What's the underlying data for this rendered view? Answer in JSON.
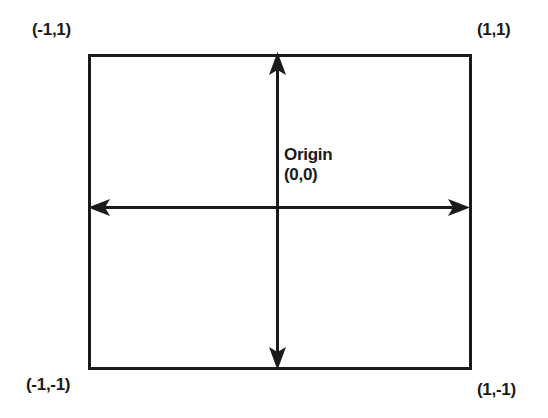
{
  "diagram": {
    "type": "coordinate-diagram",
    "stroke_color": "#1a1a1a",
    "background_color": "#ffffff",
    "box": {
      "name": "coordinate-box",
      "x": 88,
      "y": 54,
      "width": 382,
      "height": 314,
      "stroke_width": 3
    },
    "axes": {
      "horizontal": {
        "name": "x-axis",
        "y": 207.5,
        "x_start": 88,
        "x_end": 470,
        "stroke_width": 3,
        "arrow_left": true,
        "arrow_right": true
      },
      "vertical": {
        "name": "y-axis",
        "x": 277.5,
        "y_start": 54,
        "y_end": 368,
        "stroke_width": 3,
        "arrow_up": true,
        "arrow_down": true
      }
    },
    "corner_labels": {
      "top_left": "(-1,1)",
      "top_right": "(1,1)",
      "bottom_left": "(-1,-1)",
      "bottom_right": "(1,-1)"
    },
    "origin": {
      "name_text": "Origin",
      "coordinate_text": "(0,0)"
    }
  }
}
